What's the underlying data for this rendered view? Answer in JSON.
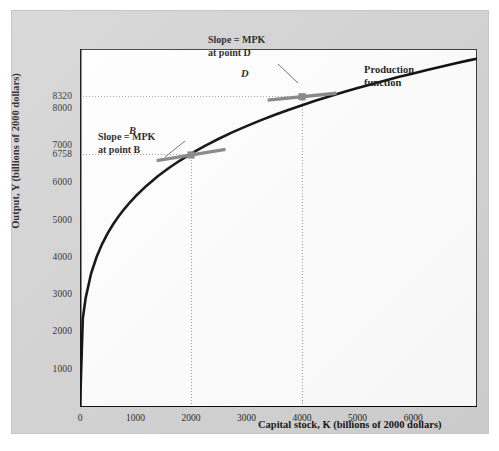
{
  "figure": {
    "background_color": "#ffffff",
    "panel_color": "#d2d2d2",
    "plot_color": "#ffffff",
    "curve_color": "#000000",
    "tangent_color": "#808080",
    "point_color": "#808080",
    "grid_color": "#999999"
  },
  "axes": {
    "x_title": "Capital stock, K (billions of 2000 dollars)",
    "y_title": "Output, Y (billions of 2000 dollars)"
  },
  "annotations": {
    "slope_b_line1": "Slope = MPK",
    "slope_b_line2": "at point B",
    "slope_d_line1": "Slope = MPK",
    "slope_d_line2": "at point D",
    "production_function_line1": "Production",
    "production_function_line2": "function",
    "point_b_label": "B",
    "point_d_label": "D"
  },
  "chart_data": {
    "type": "line",
    "title": "",
    "xlabel": "Capital stock, K (billions of 2000 dollars)",
    "ylabel": "Output, Y (billions of 2000 dollars)",
    "xlim": [
      0,
      7150
    ],
    "ylim": [
      0,
      9600
    ],
    "grid": false,
    "legend": "none",
    "xticks": [
      0,
      1000,
      2000,
      3000,
      4000,
      5000,
      6000
    ],
    "xtick_labels": [
      "0",
      "1000",
      "2000",
      "3000",
      "4000",
      "5000",
      "6000"
    ],
    "yticks": [
      1000,
      2000,
      3000,
      4000,
      5000,
      6000,
      6758,
      7000,
      8000,
      8320
    ],
    "ytick_labels": [
      "1000",
      "2000",
      "3000",
      "4000",
      "5000",
      "6000",
      "6758",
      "7000",
      "8000",
      "8320"
    ],
    "series": [
      {
        "name": "Production function",
        "type": "curve",
        "formula_note": "Y = 165 * K^0.3",
        "x": [
          0,
          50,
          100,
          200,
          300,
          400,
          500,
          600,
          700,
          800,
          900,
          1000,
          1200,
          1400,
          1600,
          1800,
          2000,
          2250,
          2500,
          2750,
          3000,
          3250,
          3500,
          3750,
          4000,
          4250,
          4500,
          4750,
          5000,
          5250,
          5500,
          5750,
          6000,
          6250,
          6500,
          6750,
          7000,
          7150
        ],
        "y": [
          0,
          2363,
          2908,
          3580,
          4029,
          4376,
          4662,
          4907,
          5122,
          5315,
          5490,
          5650,
          5936,
          6186,
          6408,
          6609,
          6793,
          7003,
          7194,
          7370,
          7533,
          7686,
          7830,
          7965,
          8094,
          8216,
          8333,
          8445,
          8552,
          8656,
          8756,
          8853,
          8946,
          9037,
          9125,
          9211,
          9295,
          9340
        ]
      }
    ],
    "points": [
      {
        "label": "B",
        "x": 2000,
        "y": 6758,
        "tangent_slope_note": "MPK at point B"
      },
      {
        "label": "D",
        "x": 4000,
        "y": 8320,
        "tangent_slope_note": "MPK at point D"
      }
    ],
    "guide_lines": [
      {
        "type": "horizontal",
        "value": 6758,
        "style": "dotted",
        "from_x": 0,
        "to_x": 2000
      },
      {
        "type": "horizontal",
        "value": 8320,
        "style": "dotted",
        "from_x": 0,
        "to_x": 4000
      },
      {
        "type": "vertical",
        "value": 2000,
        "style": "dotted",
        "from_y": 0,
        "to_y": 6758
      },
      {
        "type": "vertical",
        "value": 4000,
        "style": "dotted",
        "from_y": 0,
        "to_y": 8320
      }
    ]
  }
}
